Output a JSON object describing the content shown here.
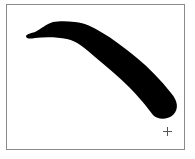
{
  "canvas": {
    "background_color": "#ffffff",
    "border_color": "#8a8a8a",
    "stroke": {
      "color": "#000000",
      "tool": "brush"
    },
    "cursor": {
      "type": "crosshair-icon",
      "x": 167,
      "y": 131
    }
  }
}
